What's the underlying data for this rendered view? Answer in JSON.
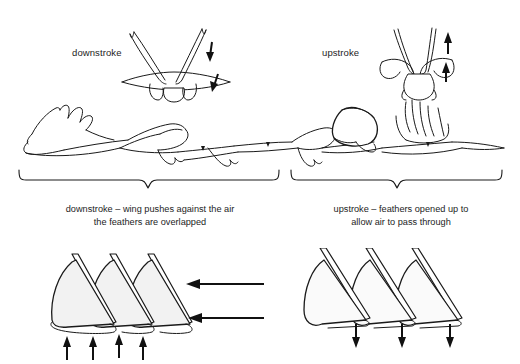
{
  "figure": {
    "background_color": "#ffffff",
    "ink_color": "#1a1a1a",
    "width": 520,
    "height": 364
  },
  "labels": {
    "downstroke": "downstroke",
    "upstroke": "upstroke"
  },
  "captions": {
    "downstroke": {
      "line1": "downstroke – wing pushes against the air",
      "line2": "the feathers are overlapped"
    },
    "upstroke": {
      "line1": "upstroke – feathers opened up to",
      "line2": "allow air to pass through"
    }
  },
  "panels": {
    "top_left": {
      "name": "downstroke-front-view",
      "description": "front view of bird with wings raised, arrows pointing down",
      "arrow_direction": "down",
      "arrow_count": 2
    },
    "top_right": {
      "name": "upstroke-front-view",
      "description": "front view of bird with wings lowered and feathers splayed, arrows pointing up",
      "arrow_direction": "up",
      "arrow_count": 2
    },
    "middle": {
      "name": "flight-sequence-side-view",
      "description": "side view sequence of bird through wingbeat cycle",
      "frame_count": 6
    },
    "bottom_left": {
      "name": "overlapped-feathers-diagram",
      "feather_count": 3,
      "horizontal_arrows": 2,
      "horizontal_arrow_direction": "left",
      "vertical_arrows": 4,
      "vertical_arrow_direction": "up"
    },
    "bottom_right": {
      "name": "opened-feathers-diagram",
      "feather_count": 3,
      "horizontal_arrows": 0,
      "vertical_arrows": 3,
      "vertical_arrow_direction": "down"
    }
  },
  "braces": {
    "left": {
      "name": "downstroke-brace",
      "x_start": 18,
      "x_end": 280
    },
    "right": {
      "name": "upstroke-brace",
      "x_start": 290,
      "x_end": 502
    }
  }
}
